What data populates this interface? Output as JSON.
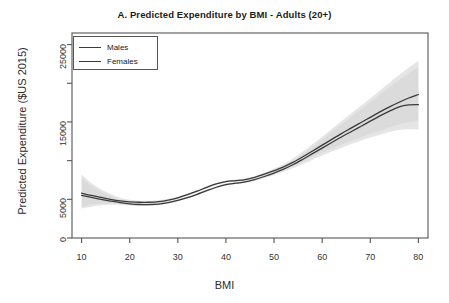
{
  "chart_data": {
    "type": "line",
    "title": "A. Predicted Expenditure by BMI - Adults (20+)",
    "xlabel": "BMI",
    "ylabel": "Predicted Expenditure ($US 2015)",
    "xlim": [
      8,
      82
    ],
    "ylim": [
      0,
      26500
    ],
    "grid": false,
    "legend_position": "top-left",
    "xticks": [
      10,
      20,
      30,
      40,
      50,
      60,
      70,
      80
    ],
    "xtick_labels": [
      "10",
      "20",
      "30",
      "40",
      "50",
      "60",
      "70",
      "80"
    ],
    "yticks": [
      0,
      5000,
      10000,
      15000,
      20000,
      25000
    ],
    "ytick_labels": [
      "0",
      "5000",
      "",
      "15000",
      "",
      "25000"
    ],
    "x": [
      10,
      12,
      14,
      16,
      18,
      20,
      22,
      24,
      26,
      28,
      30,
      32,
      34,
      36,
      38,
      40,
      42,
      44,
      46,
      48,
      50,
      52,
      54,
      56,
      58,
      60,
      62,
      64,
      66,
      68,
      70,
      72,
      74,
      76,
      78,
      80
    ],
    "series": [
      {
        "name": "Males",
        "color": "#3a3a3a",
        "values": [
          5800,
          5500,
          5250,
          5000,
          4800,
          4680,
          4620,
          4620,
          4700,
          4900,
          5200,
          5600,
          6050,
          6550,
          7000,
          7300,
          7420,
          7560,
          7850,
          8250,
          8700,
          9200,
          9800,
          10500,
          11250,
          12000,
          12750,
          13500,
          14200,
          14900,
          15600,
          16300,
          16950,
          17550,
          18100,
          18550
        ],
        "ci_lower": [
          4000,
          4300,
          4450,
          4500,
          4480,
          4440,
          4420,
          4430,
          4520,
          4740,
          5060,
          5470,
          5930,
          6430,
          6880,
          7170,
          7280,
          7410,
          7680,
          8050,
          8440,
          8860,
          9350,
          9900,
          10480,
          11040,
          11580,
          12100,
          12580,
          13030,
          13480,
          13900,
          14300,
          14650,
          14950,
          15150
        ],
        "ci_upper": [
          8200,
          7100,
          6300,
          5700,
          5200,
          4940,
          4830,
          4820,
          4890,
          5080,
          5360,
          5740,
          6180,
          6680,
          7130,
          7440,
          7570,
          7720,
          8030,
          8470,
          8980,
          9570,
          10300,
          11180,
          12130,
          13100,
          14100,
          15100,
          16080,
          17060,
          18060,
          19080,
          20080,
          21060,
          22000,
          22900
        ]
      },
      {
        "name": "Females",
        "color": "#3a3a3a",
        "values": [
          5500,
          5250,
          5000,
          4780,
          4580,
          4420,
          4330,
          4310,
          4380,
          4560,
          4850,
          5220,
          5650,
          6120,
          6560,
          6900,
          7080,
          7250,
          7550,
          7950,
          8400,
          8900,
          9500,
          10180,
          10900,
          11620,
          12340,
          13060,
          13740,
          14420,
          15100,
          15780,
          16400,
          16950,
          17200,
          17250
        ],
        "ci_lower": [
          3800,
          4050,
          4220,
          4290,
          4280,
          4210,
          4150,
          4140,
          4220,
          4420,
          4730,
          5110,
          5550,
          6020,
          6460,
          6790,
          6960,
          7120,
          7400,
          7770,
          8160,
          8570,
          9040,
          9570,
          10120,
          10660,
          11180,
          11680,
          12140,
          12570,
          12990,
          13360,
          13700,
          13950,
          14050,
          14020
        ],
        "ci_upper": [
          7800,
          6750,
          6000,
          5420,
          4950,
          4680,
          4560,
          4540,
          4600,
          4770,
          5030,
          5380,
          5800,
          6270,
          6700,
          7040,
          7220,
          7400,
          7720,
          8150,
          8660,
          9250,
          9980,
          10850,
          11790,
          12740,
          13710,
          14700,
          15650,
          16600,
          17560,
          18540,
          19500,
          20430,
          21300,
          22100
        ]
      }
    ],
    "annotations": []
  },
  "legend": {
    "entries": [
      {
        "label": "Males"
      },
      {
        "label": "Females"
      }
    ]
  },
  "style": {
    "band_color": "#d5d5d5",
    "axis_color": "#555555",
    "line_color": "#3a3a3a",
    "background": "#ffffff"
  }
}
